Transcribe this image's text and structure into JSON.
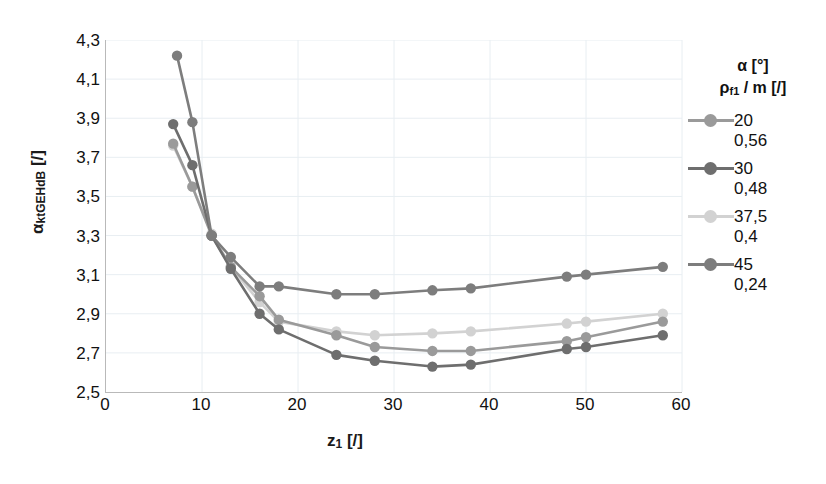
{
  "chart_data": {
    "type": "line",
    "title": "",
    "xlabel": "z1 [/]",
    "ylabel": "alpha_ktGEHdB [/]",
    "xlim": [
      0,
      60
    ],
    "ylim": [
      2.5,
      4.3
    ],
    "xticks": [
      0,
      10,
      20,
      30,
      40,
      50,
      60
    ],
    "yticks": [
      "2,5",
      "2,7",
      "2,9",
      "3,1",
      "3,3",
      "3,5",
      "3,7",
      "3,9",
      "4,1",
      "4,3"
    ],
    "grid": true,
    "legend_position": "right",
    "legend_title_line1": "α [°]",
    "legend_title_line2": "ρf1 / m [/]",
    "series": [
      {
        "name": "20",
        "alpha_deg": "20",
        "rho_f1_m": "0,56",
        "color": "#9a9a9a",
        "x": [
          7,
          9,
          11,
          13,
          16,
          18,
          24,
          28,
          34,
          38,
          48,
          50,
          58
        ],
        "y": [
          3.77,
          3.55,
          3.3,
          3.14,
          2.99,
          2.87,
          2.79,
          2.73,
          2.71,
          2.71,
          2.76,
          2.78,
          2.86
        ]
      },
      {
        "name": "30",
        "alpha_deg": "30",
        "rho_f1_m": "0,48",
        "color": "#6e6e6e",
        "x": [
          7,
          9,
          11,
          13,
          16,
          18,
          24,
          28,
          34,
          38,
          48,
          50,
          58
        ],
        "y": [
          3.87,
          3.66,
          3.3,
          3.13,
          2.9,
          2.82,
          2.69,
          2.66,
          2.63,
          2.64,
          2.72,
          2.73,
          2.79
        ]
      },
      {
        "name": "37,5",
        "alpha_deg": "37,5",
        "rho_f1_m": "0,4",
        "color": "#d2d2d2",
        "x": [
          7,
          9,
          11,
          13,
          16,
          18,
          24,
          28,
          34,
          38,
          48,
          50,
          58
        ],
        "y": [
          3.76,
          3.55,
          3.31,
          3.14,
          2.96,
          2.86,
          2.81,
          2.79,
          2.8,
          2.81,
          2.85,
          2.86,
          2.9
        ]
      },
      {
        "name": "45",
        "alpha_deg": "45",
        "rho_f1_m": "0,24",
        "color": "#7d7d7d",
        "x": [
          7.4,
          9,
          11,
          13,
          16,
          18,
          24,
          28,
          34,
          38,
          48,
          50,
          58
        ],
        "y": [
          4.22,
          3.88,
          3.3,
          3.19,
          3.04,
          3.04,
          3.0,
          3.0,
          3.02,
          3.03,
          3.09,
          3.1,
          3.14
        ]
      }
    ]
  },
  "axes": {
    "y_title": "α",
    "y_title_sub": "ktGEHdB",
    "y_title_unit": " [/]",
    "x_title": "z",
    "x_title_sub": "1",
    "x_title_unit": " [/]"
  },
  "legend": {
    "title_alpha": "α [°]",
    "title_rho_main": "ρ",
    "title_rho_sub": "f1",
    "title_rho_rest": " / m [/]"
  }
}
